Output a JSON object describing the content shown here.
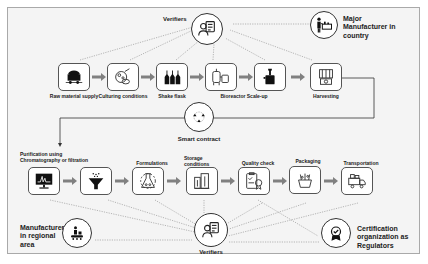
{
  "diagram": {
    "type": "supply-chain-flow",
    "colors": {
      "background": "#f4f4f4",
      "frame_border": "#a9a9a9",
      "node_border": "#555555",
      "icon": "#111111",
      "arrow": "#808080",
      "connector": "#333333",
      "dotted": "#9a9a9a"
    },
    "top_row": [
      {
        "id": "raw",
        "label": "Raw material supply",
        "icon": "mine-cart-icon"
      },
      {
        "id": "culture",
        "label": "Culturing conditions",
        "icon": "culture-cells-icon"
      },
      {
        "id": "flask",
        "label": "Shake flask",
        "icon": "flasks-icon"
      },
      {
        "id": "bioreactor",
        "label": "Bioreactor Scale-up",
        "icon": "bioreactor-icon"
      },
      {
        "id": "tank",
        "label": "",
        "icon": "fermenter-tank-icon"
      },
      {
        "id": "harvest",
        "label": "Harvesting",
        "icon": "harvesting-machine-icon"
      }
    ],
    "bottom_row": [
      {
        "id": "purify",
        "label_line1": "Purification using",
        "label_line2": "Chromatography or filtration",
        "icon": "chromatography-monitor-icon"
      },
      {
        "id": "filter",
        "label": "",
        "icon": "funnel-filter-icon"
      },
      {
        "id": "formulations",
        "label": "Formulations",
        "icon": "lab-flask-icon"
      },
      {
        "id": "storage",
        "label_line1": "Storage",
        "label_line2": "conditions",
        "icon": "storage-buildings-icon"
      },
      {
        "id": "quality",
        "label": "Quality check",
        "icon": "quality-certificate-icon"
      },
      {
        "id": "packaging",
        "label": "Packaging",
        "icon": "packaging-icon"
      },
      {
        "id": "transport",
        "label": "Transportation",
        "icon": "truck-icon"
      }
    ],
    "actors": {
      "verifiers_top": {
        "label": "Verifiers",
        "icon": "verifier-person-icon"
      },
      "verifiers_bottom": {
        "label": "Verifiers",
        "icon": "verifier-person-icon"
      },
      "smart_contract": {
        "label": "Smart contract",
        "icon": "network-nodes-icon"
      },
      "major_manufacturer": {
        "line1": "Major",
        "line2": "Manufacturer in",
        "line3": "country",
        "icon": "manufacturer-presenter-icon"
      },
      "regional_manufacturer": {
        "line1": "Manufacturer",
        "line2": "in regional",
        "line3": "area",
        "icon": "conveyor-worker-icon"
      },
      "certification": {
        "line1": "Certification",
        "line2": "organization as",
        "line3": "Regulators",
        "icon": "award-badge-icon"
      }
    }
  }
}
